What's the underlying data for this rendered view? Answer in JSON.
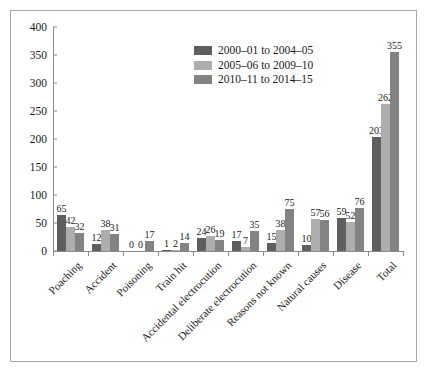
{
  "chart_data": {
    "type": "bar",
    "title": "",
    "subtitle": "",
    "xlabel": "",
    "ylabel": "",
    "ylim": [
      0,
      400
    ],
    "ytick_step": 50,
    "yticks": [
      "400",
      "350",
      "300",
      "250",
      "200",
      "150",
      "100",
      "50",
      "0"
    ],
    "grid": false,
    "legend_position": "upper-center",
    "categories": [
      "Poaching",
      "Accident",
      "Poisoning",
      "Train hit",
      "Accidental electrocution",
      "Deliberate electrocution",
      "Reasons not known",
      "Natural causes",
      "Disease",
      "Total"
    ],
    "series": [
      {
        "name": "2000–01 to 2004–05",
        "color": "#5f5f5f",
        "values": [
          65,
          12,
          0,
          1,
          24,
          17,
          15,
          10,
          59,
          203
        ]
      },
      {
        "name": "2005–06 to 2009–10",
        "color": "#adadad",
        "values": [
          42,
          38,
          0,
          2,
          26,
          7,
          38,
          57,
          52,
          262
        ]
      },
      {
        "name": "2010–11 to 2014–15",
        "color": "#838383",
        "values": [
          32,
          31,
          17,
          14,
          19,
          35,
          75,
          56,
          76,
          355
        ]
      }
    ]
  },
  "colors": {
    "series_1": "#5f5f5f",
    "series_2": "#adadad",
    "series_3": "#838383",
    "axis": "#8a8a8a",
    "frame_border": "#a8a8a8",
    "text": "#1a1a1a",
    "background": "#ffffff"
  }
}
